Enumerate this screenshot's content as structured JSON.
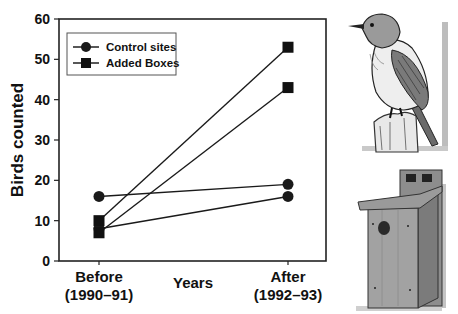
{
  "chart_data": {
    "type": "line",
    "title": "",
    "xlabel": "Years",
    "ylabel": "Birds counted",
    "ylim": [
      0,
      60
    ],
    "yticks": [
      0,
      10,
      20,
      30,
      40,
      50,
      60
    ],
    "categories": [
      "Before\n(1990-91)",
      "After\n(1992-93)"
    ],
    "category_lines": [
      [
        "Before",
        "(1990–91)"
      ],
      [
        "After",
        "(1992–93)"
      ]
    ],
    "grid": false,
    "legend_position": "upper-left",
    "series": [
      {
        "name": "Control sites",
        "marker": "circle",
        "values": [
          16,
          19
        ]
      },
      {
        "name": "Control sites",
        "marker": "circle",
        "values": [
          8,
          16
        ]
      },
      {
        "name": "Added Boxes",
        "marker": "square",
        "values": [
          10,
          53
        ]
      },
      {
        "name": "Added Boxes",
        "marker": "square",
        "values": [
          7,
          43
        ]
      }
    ],
    "legend": [
      {
        "label": "Control sites",
        "marker": "circle"
      },
      {
        "label": "Added Boxes",
        "marker": "square"
      }
    ]
  },
  "illustrations": {
    "top": "Songbird perched on a wooden post",
    "bottom": "Wooden nest box with round entrance hole"
  }
}
